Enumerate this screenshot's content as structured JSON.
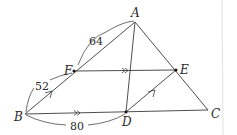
{
  "diagram": {
    "type": "triangle-with-parallel-lines",
    "points": {
      "A": {
        "label": "A",
        "x": 135,
        "y": 22
      },
      "B": {
        "label": "B",
        "x": 25,
        "y": 114
      },
      "C": {
        "label": "C",
        "x": 208,
        "y": 110
      },
      "D": {
        "label": "D",
        "x": 126,
        "y": 112
      },
      "E": {
        "label": "E",
        "x": 176,
        "y": 70
      },
      "F": {
        "label": "F",
        "x": 74,
        "y": 71
      }
    },
    "segments": [
      "AB",
      "AC",
      "BC",
      "AD",
      "FE",
      "DE"
    ],
    "parallel_marks": {
      "double_arrow": [
        "FE",
        "BD"
      ],
      "single_arrow": [
        "BF",
        "DE"
      ]
    },
    "measurements": {
      "AF": "64",
      "FB": "52",
      "BD": "80"
    },
    "colors": {
      "line": "#3a3a3a",
      "text": "#2a2a2a",
      "background": "#ffffff"
    }
  }
}
